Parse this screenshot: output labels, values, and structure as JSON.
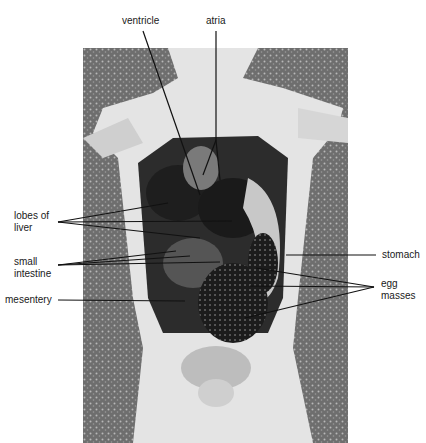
{
  "figure": {
    "colors": {
      "background": "#ffffff",
      "label_text": "#1a1a1a",
      "leader_line": "#111111"
    }
  },
  "labels": {
    "ventricle": "ventricle",
    "atria": "atria",
    "lobes_of_liver_1": "lobes of",
    "lobes_of_liver_2": "liver",
    "small_intestine_1": "small",
    "small_intestine_2": "intestine",
    "mesentery": "mesentery",
    "stomach": "stomach",
    "egg_masses_1": "egg",
    "egg_masses_2": "masses"
  }
}
